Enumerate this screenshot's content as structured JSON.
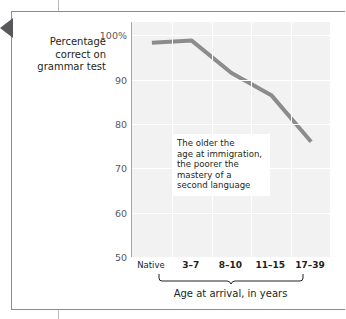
{
  "figure": {
    "pointer_icon": "left-triangle-pointer"
  },
  "chart_data": {
    "type": "line",
    "title": "",
    "subtitle": "",
    "xlabel": "Age at arrival, in years",
    "ylabel": "Percentage correct on grammar test",
    "categories": [
      "Native",
      "3–7",
      "8–10",
      "11–15",
      "17–39"
    ],
    "values": [
      98.3,
      98.8,
      91.5,
      86.5,
      76.0
    ],
    "series": [
      {
        "name": "Percentage correct on grammar test",
        "values": [
          98.3,
          98.8,
          91.5,
          86.5,
          76.0
        ]
      }
    ],
    "ylim": [
      50,
      103
    ],
    "yticks": [
      100,
      90,
      80,
      70,
      60,
      50
    ],
    "ytick_labels": [
      "100%",
      "90",
      "80",
      "70",
      "60",
      "50"
    ],
    "grid": true,
    "legend": "none",
    "line_color": "#8c8c8c",
    "plot_background": "#f1f1f1",
    "gridline_color": "#ffffff",
    "annotations": [
      {
        "name": "trend-callout",
        "lines": [
          "The older the",
          "age at immigration,",
          "the poorer the",
          "mastery of a",
          "second language"
        ]
      }
    ],
    "bracket": {
      "label": "Age at arrival, in years",
      "spans_categories": [
        "3–7",
        "17–39"
      ]
    }
  },
  "axis": {
    "y_title_lines": [
      "Percentage",
      "correct on",
      "grammar test"
    ]
  }
}
